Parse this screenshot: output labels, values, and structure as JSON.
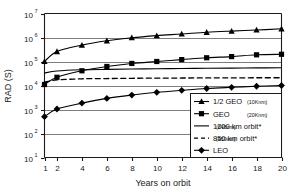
{
  "chart_data": {
    "type": "line",
    "title": "",
    "xlabel": "Years on orbit",
    "ylabel": "RAD (S)",
    "xlim": [
      1,
      20
    ],
    "ylim": [
      10,
      10000000
    ],
    "yscale": "log",
    "grid": true,
    "legend_position": "bottom-right",
    "xticks": [
      1,
      2,
      4,
      6,
      8,
      10,
      12,
      14,
      16,
      18,
      20
    ],
    "xtick_labels": [
      "1",
      "2",
      "4",
      "6",
      "8",
      "10",
      "12",
      "14",
      "16",
      "18",
      "20"
    ],
    "ytick_labels": [
      "10¹",
      "10²",
      "10³",
      "10⁴",
      "10⁵",
      "10⁶",
      "10⁷"
    ],
    "ytick_base": "10",
    "ytick_exponents": [
      "1",
      "2",
      "3",
      "4",
      "5",
      "6",
      "7"
    ],
    "x": [
      1,
      2,
      4,
      6,
      8,
      10,
      12,
      14,
      16,
      18,
      20
    ],
    "series": [
      {
        "name": "1/2 GEO",
        "detail": "(10Knm)",
        "marker": "triangle",
        "style": "solid",
        "color": "#000000",
        "values": [
          100000,
          260000,
          480000,
          730000,
          980000,
          1200000,
          1400000,
          1650000,
          1850000,
          2050000,
          2300000
        ]
      },
      {
        "name": "GEO",
        "detail": "(20Knm)",
        "marker": "square",
        "style": "solid",
        "color": "#000000",
        "values": [
          11000,
          22000,
          41000,
          62000,
          83000,
          100000,
          120000,
          143000,
          160000,
          190000,
          200000
        ]
      },
      {
        "name": "1200 km orbit*",
        "detail": "(648nm)",
        "marker": "none",
        "style": "solid",
        "color": "#000000",
        "values": [
          33000,
          40000,
          45000,
          47000,
          48500,
          50000,
          51000,
          52000,
          53000,
          54000,
          55000
        ]
      },
      {
        "name": "850 km orbit*",
        "detail": "(459nm)",
        "marker": "none",
        "style": "dashed",
        "color": "#000000",
        "values": [
          14000,
          17000,
          19000,
          19500,
          20000,
          20200,
          20500,
          20700,
          20900,
          21000,
          21000
        ]
      },
      {
        "name": "LEO",
        "detail": "",
        "marker": "diamond",
        "style": "solid",
        "color": "#000000",
        "values": [
          500,
          1050,
          1850,
          2900,
          4000,
          5200,
          6300,
          7500,
          8400,
          9300,
          10000
        ]
      }
    ]
  },
  "legend": {
    "entries": [
      {
        "label": "1/2 GEO",
        "paren": "(10Knm)"
      },
      {
        "label": "GEO",
        "paren": "(20Knm)"
      },
      {
        "label": "1200 km orbit*",
        "paren": "(648nm)"
      },
      {
        "label": "850 km orbit*",
        "paren": "(459nm)"
      },
      {
        "label": "LEO",
        "paren": ""
      }
    ]
  },
  "colors": {
    "axis": "#1a1a1a",
    "grid": "#808080",
    "series": "#000000",
    "background": "#ffffff"
  }
}
